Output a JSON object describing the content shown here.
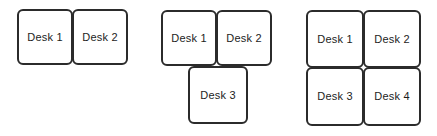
{
  "diagram": {
    "background_color": "#ffffff",
    "border_color": "#2b2b2b",
    "label_color": "#1c1c1c",
    "groups": [
      {
        "name": "two-desk-row",
        "desk_count": 2,
        "desks": [
          {
            "label": "Desk 1",
            "x": 17,
            "y": 9,
            "w": 56,
            "h": 56
          },
          {
            "label": "Desk 2",
            "x": 72,
            "y": 9,
            "w": 56,
            "h": 56
          }
        ]
      },
      {
        "name": "three-desk-t-shape",
        "desk_count": 3,
        "desks": [
          {
            "label": "Desk 1",
            "x": 161,
            "y": 10,
            "w": 56,
            "h": 56
          },
          {
            "label": "Desk 2",
            "x": 216,
            "y": 10,
            "w": 56,
            "h": 56
          },
          {
            "label": "Desk 3",
            "x": 188,
            "y": 66,
            "w": 60,
            "h": 58
          }
        ]
      },
      {
        "name": "four-desk-grid",
        "desk_count": 4,
        "desks": [
          {
            "label": "Desk 1",
            "x": 306,
            "y": 10,
            "w": 58,
            "h": 58
          },
          {
            "label": "Desk 2",
            "x": 363,
            "y": 10,
            "w": 58,
            "h": 58
          },
          {
            "label": "Desk 3",
            "x": 306,
            "y": 67,
            "w": 58,
            "h": 59
          },
          {
            "label": "Desk 4",
            "x": 363,
            "y": 67,
            "w": 58,
            "h": 59
          }
        ]
      }
    ]
  }
}
